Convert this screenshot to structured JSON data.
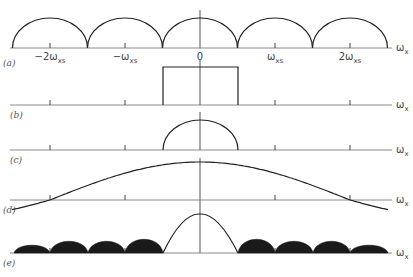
{
  "figure": {
    "axis_label": "ω",
    "axis_label_sub": "x",
    "tick_labels": [
      {
        "main": "−2ω",
        "sub": "xs"
      },
      {
        "main": "−ω",
        "sub": "xs"
      },
      {
        "main": "0",
        "sub": ""
      },
      {
        "main": "ω",
        "sub": "xs"
      },
      {
        "main": "2ω",
        "sub": "xs"
      }
    ],
    "tick_values_in_wxs": [
      -2,
      -1,
      0,
      1,
      2
    ],
    "panels": [
      {
        "id": "a",
        "label": "(a)",
        "description": "Periodic replicas of semicircular spectrum, period ω_xs"
      },
      {
        "id": "b",
        "label": "(b)",
        "description": "Ideal rectangular lowpass filter from −ω_xs/2 to ω_xs/2"
      },
      {
        "id": "c",
        "label": "(c)",
        "description": "Recovered single semicircular spectrum"
      },
      {
        "id": "d",
        "label": "(d)",
        "description": "Non-ideal interpolation filter response with sidelobes, zeros at ±2ω_xs"
      },
      {
        "id": "e",
        "label": "(e)",
        "description": "Product spectrum: main lobe plus shaded aliasing residue"
      }
    ]
  }
}
